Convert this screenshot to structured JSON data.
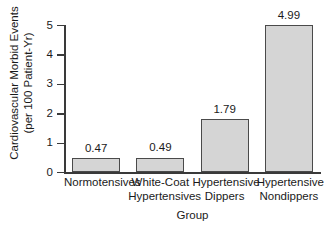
{
  "chart_data": {
    "type": "bar",
    "title": "",
    "subtitle": "",
    "categories": [
      "Normotensives",
      "White-Coat Hypertensives",
      "Hypertensive Dippers",
      "Hypertensive Nondippers"
    ],
    "category_lines": [
      [
        "Normotensives"
      ],
      [
        "White-Coat",
        "Hypertensives"
      ],
      [
        "Hypertensive",
        "Dippers"
      ],
      [
        "Hypertensive",
        "Nondippers"
      ]
    ],
    "values": [
      0.47,
      0.49,
      1.79,
      4.99
    ],
    "value_labels": [
      "0.47",
      "0.49",
      "1.79",
      "4.99"
    ],
    "xlabel": "Group",
    "ylabel": "Cardiovascular Morbid Events (per 100 Patient-Yr)",
    "ylabel_lines": [
      "Cardiovascular Morbid Events",
      "(per 100 Patient-Yr)"
    ],
    "ylim": [
      0,
      5
    ],
    "yticks": [
      5,
      4,
      3,
      2,
      1,
      0
    ],
    "ytick_labels": [
      "5",
      "4",
      "3",
      "2",
      "1",
      "0"
    ],
    "grid": false,
    "legend": false,
    "legend_position": "none",
    "bar_fill_color": "#d5d5d5",
    "bar_edge_color": "#4a4a4a",
    "axis_color": "#3a3a3a",
    "text_color": "#1a1a1a",
    "background_color": "#ffffff"
  }
}
